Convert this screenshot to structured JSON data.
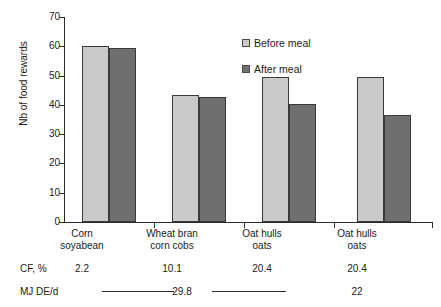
{
  "chart_data": {
    "type": "bar",
    "title": "",
    "xlabel": "",
    "ylabel": "Nb of food rewards",
    "ylim": [
      0,
      70
    ],
    "yticks": [
      0,
      10,
      20,
      30,
      40,
      50,
      60,
      70
    ],
    "grid": false,
    "legend_position": "top-center",
    "categories": [
      "Corn soyabean",
      "Wheat bran corn cobs",
      "Oat hulls oats",
      "Oat hulls oats"
    ],
    "category_lines": [
      [
        "Corn",
        "soyabean"
      ],
      [
        "Wheat bran",
        "corn cobs"
      ],
      [
        "Oat hulls",
        "oats"
      ],
      [
        "Oat hulls",
        "oats"
      ]
    ],
    "series": [
      {
        "name": "Before meal",
        "color": "#c9c9c9",
        "values": [
          60,
          43.3,
          49.5,
          49.5
        ]
      },
      {
        "name": "After meal",
        "color": "#6f6f6f",
        "values": [
          59.5,
          42.7,
          40.3,
          36.5
        ]
      }
    ]
  },
  "axis": {
    "y_title": "Nb of food rewards",
    "y_ticks": [
      "70",
      "60",
      "50",
      "40",
      "30",
      "20",
      "10",
      "0"
    ]
  },
  "legend": {
    "items": [
      {
        "label": "Before meal",
        "swatch": "light-gray-square"
      },
      {
        "label": "After meal",
        "swatch": "dark-gray-square"
      }
    ]
  },
  "categories": [
    {
      "line1": "Corn",
      "line2": "soyabean",
      "cf": "2.2"
    },
    {
      "line1": "Wheat bran",
      "line2": "corn cobs",
      "cf": "10.1"
    },
    {
      "line1": "Oat hulls",
      "line2": "oats",
      "cf": "20.4"
    },
    {
      "line1": "Oat hulls",
      "line2": "oats",
      "cf": "20.4"
    }
  ],
  "table": {
    "cf_label": "CF, %",
    "mj_label": "MJ DE/d",
    "mj_values": [
      {
        "value": "29.8",
        "span": "groups-1-to-3"
      },
      {
        "value": "22",
        "span": "group-4"
      }
    ]
  }
}
